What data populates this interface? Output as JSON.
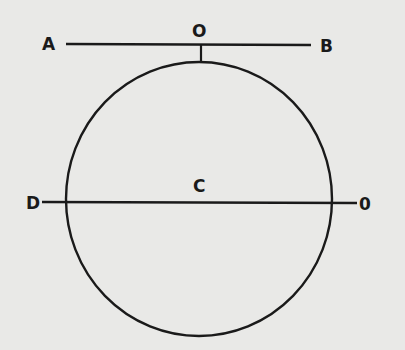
{
  "diagram": {
    "background": "#e9e9e7",
    "stroke_color": "#1a1a1a",
    "labels": {
      "a": "A",
      "b": "B",
      "o_top": "O",
      "c": "C",
      "d": "D",
      "o_right": "0"
    },
    "shapes": {
      "circle": {
        "cx": 199,
        "cy": 199,
        "rx": 133,
        "ry": 137
      },
      "line_ab": {
        "x1": 66,
        "y1": 44,
        "x2": 311,
        "y2": 45
      },
      "tangent_tick": {
        "x1": 201,
        "y1": 45,
        "x2": 201,
        "y2": 62
      },
      "line_do": {
        "x1": 42,
        "y1": 202,
        "x2": 357,
        "y2": 203
      }
    }
  }
}
